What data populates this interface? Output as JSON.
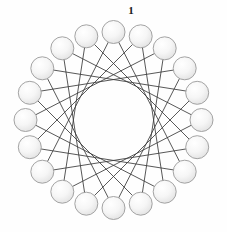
{
  "figure": {
    "title": "",
    "background_color": "#fefefe",
    "width": 227,
    "height": 232
  },
  "labels": [
    {
      "text": "1",
      "name": "node-label-1",
      "x": 131,
      "y": 10,
      "for_node": 0
    }
  ],
  "chart_data": {
    "type": "diagram",
    "subtype": "circulant-graph",
    "title": "",
    "xlabel": "",
    "ylabel": "",
    "grid": false,
    "legend": null,
    "node_count": 20,
    "chord_step": 7,
    "start_angle_deg": -90,
    "center": {
      "x": 113.5,
      "y": 120
    },
    "node_ring_radius": 88,
    "node_radius": 11.5,
    "envelope_radius": 53,
    "node_style": {
      "fill_light": "#fdfdfd",
      "fill_dark": "#e6e6e6",
      "stroke": "#9a9a9a",
      "stroke_width": 0.9
    },
    "edge_style": {
      "stroke": "#3a3a3a",
      "stroke_width": 0.85
    },
    "nodes": [
      {
        "id": 1,
        "angle_deg": -90,
        "x": 113.5,
        "y": 32.0
      },
      {
        "id": 2,
        "angle_deg": -72,
        "x": 140.7,
        "y": 36.3
      },
      {
        "id": 3,
        "angle_deg": -54,
        "x": 164.7,
        "y": 48.3
      },
      {
        "id": 4,
        "angle_deg": -36,
        "x": 184.7,
        "y": 68.3
      },
      {
        "id": 5,
        "angle_deg": -18,
        "x": 197.2,
        "y": 92.8
      },
      {
        "id": 6,
        "angle_deg": 0,
        "x": 201.5,
        "y": 120.0
      },
      {
        "id": 7,
        "angle_deg": 18,
        "x": 197.2,
        "y": 147.2
      },
      {
        "id": 8,
        "angle_deg": 36,
        "x": 184.7,
        "y": 171.7
      },
      {
        "id": 9,
        "angle_deg": 54,
        "x": 164.7,
        "y": 191.7
      },
      {
        "id": 10,
        "angle_deg": 72,
        "x": 140.7,
        "y": 203.7
      },
      {
        "id": 11,
        "angle_deg": 90,
        "x": 113.5,
        "y": 208.0
      },
      {
        "id": 12,
        "angle_deg": 108,
        "x": 86.3,
        "y": 203.7
      },
      {
        "id": 13,
        "angle_deg": 126,
        "x": 62.3,
        "y": 191.7
      },
      {
        "id": 14,
        "angle_deg": 144,
        "x": 42.3,
        "y": 171.7
      },
      {
        "id": 15,
        "angle_deg": 162,
        "x": 29.8,
        "y": 147.2
      },
      {
        "id": 16,
        "angle_deg": 180,
        "x": 25.5,
        "y": 120.0
      },
      {
        "id": 17,
        "angle_deg": 198,
        "x": 29.8,
        "y": 92.8
      },
      {
        "id": 18,
        "angle_deg": 216,
        "x": 42.3,
        "y": 68.3
      },
      {
        "id": 19,
        "angle_deg": 234,
        "x": 62.3,
        "y": 48.3
      },
      {
        "id": 20,
        "angle_deg": 252,
        "x": 86.3,
        "y": 36.3
      }
    ],
    "edges": [
      {
        "from": 1,
        "to": 8
      },
      {
        "from": 2,
        "to": 9
      },
      {
        "from": 3,
        "to": 10
      },
      {
        "from": 4,
        "to": 11
      },
      {
        "from": 5,
        "to": 12
      },
      {
        "from": 6,
        "to": 13
      },
      {
        "from": 7,
        "to": 14
      },
      {
        "from": 8,
        "to": 15
      },
      {
        "from": 9,
        "to": 16
      },
      {
        "from": 10,
        "to": 17
      },
      {
        "from": 11,
        "to": 18
      },
      {
        "from": 12,
        "to": 19
      },
      {
        "from": 13,
        "to": 20
      },
      {
        "from": 14,
        "to": 1
      },
      {
        "from": 15,
        "to": 2
      },
      {
        "from": 16,
        "to": 3
      },
      {
        "from": 17,
        "to": 4
      },
      {
        "from": 18,
        "to": 5
      },
      {
        "from": 19,
        "to": 6
      },
      {
        "from": 20,
        "to": 7
      }
    ]
  }
}
